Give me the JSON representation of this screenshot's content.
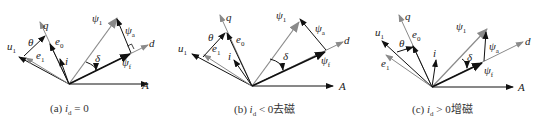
{
  "figure": {
    "colors": {
      "black": "#111111",
      "gray": "#8a8a8a",
      "text": "#222222"
    },
    "panels": [
      {
        "id": "a",
        "caption_prefix": "(a) ",
        "caption_var": "i",
        "caption_sub": "d",
        "caption_rel": " = 0",
        "caption_suffix": "",
        "labels": {
          "q": "q",
          "d": "d",
          "A": "A",
          "u1": "u",
          "u1_sub": "1",
          "e0": "e",
          "e0_sub": "0",
          "e1": "e",
          "e1_sub": "1",
          "i": "i",
          "theta": "θ",
          "delta": "δ",
          "psi1": "ψ",
          "psi1_sub": "1",
          "psia": "ψ",
          "psia_sub": "a",
          "psif": "ψ",
          "psif_sub": "f"
        }
      },
      {
        "id": "b",
        "caption_prefix": "(b) ",
        "caption_var": "i",
        "caption_sub": "d",
        "caption_rel": " < 0",
        "caption_suffix": "去磁",
        "labels": {
          "q": "q",
          "d": "d",
          "A": "A",
          "u1": "u",
          "u1_sub": "1",
          "e0": "e",
          "e0_sub": "0",
          "e1": "e",
          "e1_sub": "1",
          "i": "i",
          "theta": "θ",
          "delta": "δ",
          "psi1": "ψ",
          "psi1_sub": "1",
          "psia": "ψ",
          "psia_sub": "a",
          "psif": "ψ",
          "psif_sub": "f"
        }
      },
      {
        "id": "c",
        "caption_prefix": "(c) ",
        "caption_var": "i",
        "caption_sub": "d",
        "caption_rel": " > 0",
        "caption_suffix": "增磁",
        "labels": {
          "q": "q",
          "d": "d",
          "A": "A",
          "u1": "u",
          "u1_sub": "1",
          "e0": "e",
          "e0_sub": "0",
          "e1": "e",
          "e1_sub": "1",
          "i": "i",
          "theta": "θ",
          "delta": "δ",
          "psi1": "ψ",
          "psi1_sub": "1",
          "psia": "ψ",
          "psia_sub": "a",
          "psif": "ψ",
          "psif_sub": "f"
        }
      }
    ]
  }
}
